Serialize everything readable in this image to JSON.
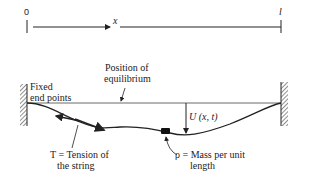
{
  "axis": {
    "start_label": "0",
    "variable_label": "x",
    "end_label": "l"
  },
  "labels": {
    "equilibrium_line1": "Position of",
    "equilibrium_line2": "equilibrium",
    "fixed_line1": "Fixed",
    "fixed_line2": "end points",
    "displacement": "U (x, t)",
    "tension_line1": "T = Tension of",
    "tension_line2": "the string",
    "mass_line1": "ρ = Mass per unit",
    "mass_line2": "length"
  },
  "colors": {
    "ink": "#222222",
    "background": "#ffffff"
  }
}
